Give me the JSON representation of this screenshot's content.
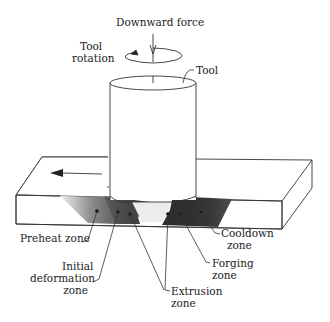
{
  "diagram": {
    "labels": {
      "downward_force": "Downward force",
      "tool_rotation_line1": "Tool",
      "tool_rotation_line2": "rotation",
      "tool": "Tool",
      "preheat": "Preheat zone",
      "initial_def_line1": "Initial",
      "initial_def_line2": "deformation",
      "initial_def_line3": "zone",
      "extrusion_line1": "Extrusion",
      "extrusion_line2": "zone",
      "forging_line1": "Forging",
      "forging_line2": "zone",
      "cooldown_line1": "Cooldown",
      "cooldown_line2": "zone"
    },
    "colors": {
      "line": "#333333",
      "zone_dark": "#3a3a3a",
      "zone_mid": "#6a6a6a",
      "zone_light": "#d8d8d8"
    }
  }
}
